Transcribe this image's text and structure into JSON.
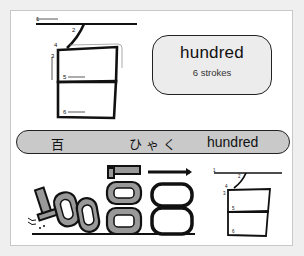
{
  "kanji": {
    "character": "百",
    "reading": "ひゃく",
    "meaning": "hundred",
    "stroke_count_label": "6 strokes"
  },
  "stroke_diagram": {
    "stroke_numbers": [
      "1",
      "2",
      "3",
      "4",
      "5",
      "6"
    ]
  },
  "illustration": {
    "description": "numbers 100 morphing into kanji",
    "digits": "100"
  }
}
